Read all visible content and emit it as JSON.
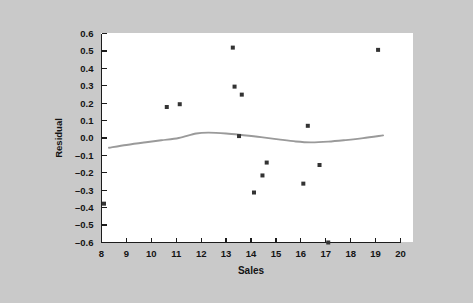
{
  "figure": {
    "background_color": "#c9c9c9",
    "panel_color": "#ffffff"
  },
  "chart_data": {
    "type": "scatter",
    "title": "",
    "subtitle": "",
    "xlabel": "Sales",
    "ylabel": "Residual",
    "xlim": [
      8,
      20
    ],
    "ylim": [
      -0.6,
      0.6
    ],
    "xticks": [
      8,
      9,
      10,
      11,
      12,
      13,
      14,
      15,
      16,
      17,
      18,
      19,
      20
    ],
    "xtick_labels": [
      "8",
      "9",
      "10",
      "11",
      "12",
      "13",
      "14",
      "15",
      "16",
      "17",
      "18",
      "19",
      "20"
    ],
    "yticks": [
      0.6,
      0.5,
      0.4,
      0.3,
      0.2,
      0.1,
      0.0,
      -0.1,
      -0.2,
      -0.3,
      -0.4,
      -0.5,
      -0.6
    ],
    "ytick_labels": [
      "0.6",
      "0.5",
      "0.4",
      "0.3",
      "0.2",
      "0.1",
      "0.0",
      "–0.1",
      "–0.2",
      "–0.3",
      "–0.4",
      "–0.5",
      "–0.6"
    ],
    "grid": false,
    "legend": null,
    "marker_color": "#333333",
    "marker_shape": "square",
    "marker_size": 4,
    "points": [
      {
        "x": 8.1,
        "y": -0.377
      },
      {
        "x": 10.62,
        "y": 0.178
      },
      {
        "x": 11.14,
        "y": 0.194
      },
      {
        "x": 13.27,
        "y": 0.519
      },
      {
        "x": 13.34,
        "y": 0.295
      },
      {
        "x": 13.63,
        "y": 0.249
      },
      {
        "x": 13.52,
        "y": 0.011
      },
      {
        "x": 14.12,
        "y": -0.313
      },
      {
        "x": 14.46,
        "y": -0.215
      },
      {
        "x": 14.63,
        "y": -0.141
      },
      {
        "x": 16.1,
        "y": -0.262
      },
      {
        "x": 16.28,
        "y": 0.07
      },
      {
        "x": 16.75,
        "y": -0.155
      },
      {
        "x": 17.1,
        "y": -0.6
      },
      {
        "x": 19.1,
        "y": 0.506
      }
    ],
    "smoother": {
      "name": "lowess-smooth",
      "color": "#9a9a9a",
      "x": [
        8.3,
        9.0,
        9.7,
        10.4,
        11.1,
        11.8,
        12.3,
        13.0,
        13.7,
        14.4,
        15.1,
        15.8,
        16.4,
        17.1,
        17.8,
        18.5,
        19.3
      ],
      "y": [
        -0.056,
        -0.04,
        -0.026,
        -0.013,
        0.0,
        0.026,
        0.031,
        0.026,
        0.016,
        0.005,
        -0.008,
        -0.02,
        -0.025,
        -0.021,
        -0.012,
        -0.001,
        0.015
      ]
    }
  }
}
